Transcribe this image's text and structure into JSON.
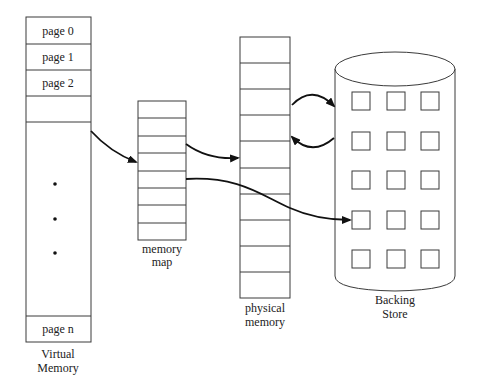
{
  "diagram": {
    "virtual_memory": {
      "title_line1": "Virtual",
      "title_line2": "Memory",
      "pages": [
        "page 0",
        "page 1",
        "page 2",
        "",
        "page n"
      ],
      "ellipsis_dots": 3
    },
    "memory_map": {
      "title_line1": "memory",
      "title_line2": "map",
      "rows": 8
    },
    "physical_memory": {
      "title_line1": "physical",
      "title_line2": "memory",
      "rows": 10
    },
    "backing_store": {
      "title_line1": "Backing",
      "title_line2": "Store",
      "block_rows": 5,
      "block_cols": 3
    },
    "arrows": [
      {
        "from": "virtual_memory",
        "to": "memory_map"
      },
      {
        "from": "memory_map",
        "to": "physical_memory"
      },
      {
        "from": "memory_map",
        "to": "backing_store"
      },
      {
        "from": "physical_memory",
        "to": "backing_store"
      },
      {
        "from": "backing_store",
        "to": "physical_memory"
      }
    ]
  }
}
